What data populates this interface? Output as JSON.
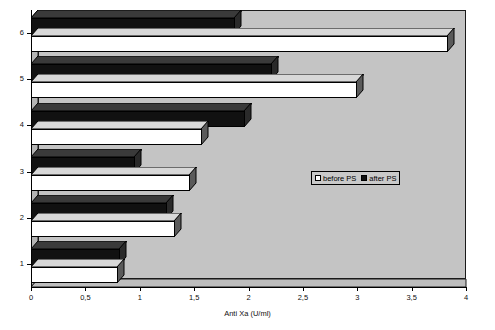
{
  "chart_data": {
    "type": "bar",
    "orientation": "horizontal",
    "title": "",
    "xlabel": "Anti Xa (U/ml)",
    "ylabel": "",
    "categories": [
      "1",
      "2",
      "3",
      "4",
      "5",
      "6"
    ],
    "xlim": [
      0,
      4
    ],
    "xticks": [
      "0",
      "0,5",
      "1",
      "1,5",
      "2",
      "2,5",
      "3",
      "3,5",
      "4"
    ],
    "xtick_values": [
      0,
      0.5,
      1,
      1.5,
      2,
      2.5,
      3,
      3.5,
      4
    ],
    "grid": false,
    "legend_position": "center-right",
    "series": [
      {
        "name": "before PS",
        "color": "#ffffff",
        "values": [
          0.8,
          1.32,
          1.46,
          1.57,
          3.0,
          3.83
        ]
      },
      {
        "name": "after PS",
        "color": "#111111",
        "values": [
          0.82,
          1.25,
          0.96,
          1.97,
          2.22,
          1.88
        ]
      }
    ]
  },
  "legend": {
    "entries": [
      {
        "label": "before PS",
        "swatch": "white"
      },
      {
        "label": "after PS",
        "swatch": "black"
      }
    ]
  },
  "axis": {
    "x_title": "Anti Xa (U/ml)"
  },
  "colors": {
    "plot_background": "#c4c4c4",
    "wall": "#b0b0b0",
    "series_before": "#ffffff",
    "series_after": "#111111",
    "axis": "#000000"
  }
}
